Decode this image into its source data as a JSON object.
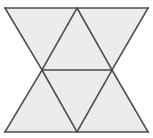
{
  "figure": {
    "name": "triangle-tessellation",
    "canvas": {
      "width": 153,
      "height": 138
    },
    "style": {
      "fill": "#ececec",
      "stroke": "#4d4d4d",
      "stroke_width": 1.6,
      "background": "#ffffff"
    },
    "vertices": {
      "top_left": [
        5,
        8
      ],
      "top_mid": [
        77,
        8
      ],
      "top_right": [
        148,
        8
      ],
      "mid_left": [
        42,
        70
      ],
      "mid_right": [
        112,
        70
      ],
      "bottom_left": [
        5,
        132
      ],
      "bottom_mid": [
        77,
        132
      ],
      "bottom_right": [
        148,
        132
      ]
    },
    "triangles": [
      {
        "id": "upper-left-down",
        "orientation": "down",
        "points": "5,8 77,8 42,70"
      },
      {
        "id": "upper-mid-up",
        "orientation": "up",
        "points": "77,8 112,70 42,70"
      },
      {
        "id": "upper-right-down",
        "orientation": "down",
        "points": "77,8 148,8 112,70"
      },
      {
        "id": "lower-left-up",
        "orientation": "up",
        "points": "42,70 77,132 5,132"
      },
      {
        "id": "lower-mid-down",
        "orientation": "down",
        "points": "42,70 112,70 77,132"
      },
      {
        "id": "lower-right-up",
        "orientation": "up",
        "points": "112,70 148,132 77,132"
      }
    ],
    "edges": [
      {
        "id": "top-edge",
        "x1": 5,
        "y1": 8,
        "x2": 148,
        "y2": 8
      },
      {
        "id": "bottom-edge",
        "x1": 5,
        "y1": 132,
        "x2": 148,
        "y2": 132
      },
      {
        "id": "middle-horizontal",
        "x1": 42,
        "y1": 70,
        "x2": 112,
        "y2": 70
      },
      {
        "id": "diag-topleft-to-midleft",
        "x1": 5,
        "y1": 8,
        "x2": 42,
        "y2": 70
      },
      {
        "id": "diag-topmid-to-midleft",
        "x1": 77,
        "y1": 8,
        "x2": 42,
        "y2": 70
      },
      {
        "id": "diag-topmid-to-midright",
        "x1": 77,
        "y1": 8,
        "x2": 112,
        "y2": 70
      },
      {
        "id": "diag-topright-to-midright",
        "x1": 148,
        "y1": 8,
        "x2": 112,
        "y2": 70
      },
      {
        "id": "diag-midleft-to-bottomleft",
        "x1": 42,
        "y1": 70,
        "x2": 5,
        "y2": 132
      },
      {
        "id": "diag-midleft-to-bottommid",
        "x1": 42,
        "y1": 70,
        "x2": 77,
        "y2": 132
      },
      {
        "id": "diag-midright-to-bottommid",
        "x1": 112,
        "y1": 70,
        "x2": 77,
        "y2": 132
      },
      {
        "id": "diag-midright-to-bottomright",
        "x1": 112,
        "y1": 70,
        "x2": 148,
        "y2": 132
      }
    ]
  }
}
